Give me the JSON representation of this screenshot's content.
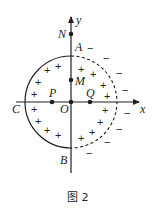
{
  "figure": {
    "caption": "图 2",
    "axes": {
      "x_label": "x",
      "y_label": "y",
      "origin_label": "O"
    },
    "circle": {
      "left_half": "solid",
      "right_half": "dashed",
      "points": {
        "top": "A",
        "bottom": "B",
        "left": "C"
      }
    },
    "points": [
      {
        "id": "N",
        "label": "N",
        "position": "on y-axis above circle"
      },
      {
        "id": "M",
        "label": "M",
        "position": "on y-axis inside circle"
      },
      {
        "id": "P",
        "label": "P",
        "position": "on x-axis left of O"
      },
      {
        "id": "Q",
        "label": "Q",
        "position": "on x-axis right of O"
      }
    ],
    "charges": {
      "inside": "+",
      "outside": "−"
    },
    "colors": {
      "ink": "#231f20",
      "background": "#ffffff"
    }
  }
}
